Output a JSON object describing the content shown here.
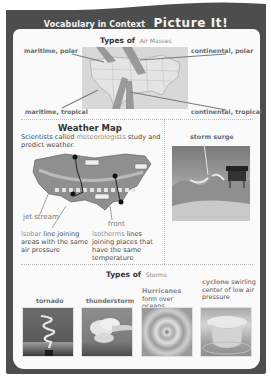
{
  "header": {
    "prefix": "Vocabulary in Context",
    "title": "Picture It!"
  },
  "air_masses": {
    "title_prefix": "Types of",
    "title_term": "Air Masses",
    "labels": {
      "maritime_polar": "maritime, polar",
      "continental_polar": "continental, polar",
      "maritime_tropical": "maritime, tropical",
      "continental_tropical": "continental, tropical"
    }
  },
  "weather_map": {
    "title": "Weather Map",
    "intro_before": "Scientists called",
    "intro_term": "meteorologists",
    "intro_after": "study and predict weather.",
    "labels": {
      "jet_stream": "jet stream",
      "front": "front"
    },
    "isobar": {
      "term": "isobar",
      "definition": "line joining areas with the same air pressure"
    },
    "isotherms": {
      "term": "isotherms",
      "definition": "lines joining places that have the same temperature"
    }
  },
  "storm_surge": {
    "label": "storm surge"
  },
  "storms": {
    "title_prefix": "Types of",
    "title_term": "Storms",
    "items": [
      {
        "label": "tornado"
      },
      {
        "label": "thunderstorm"
      },
      {
        "term": "Hurricanes",
        "description": "form over oceans."
      },
      {
        "term": "cyclone",
        "description": "swirling center of low air pressure"
      }
    ]
  },
  "colors": {
    "frame": "#4d4d4d",
    "panel": "#fafafa",
    "accent_text": "#8a8a8a",
    "heading_text": "#333333"
  }
}
